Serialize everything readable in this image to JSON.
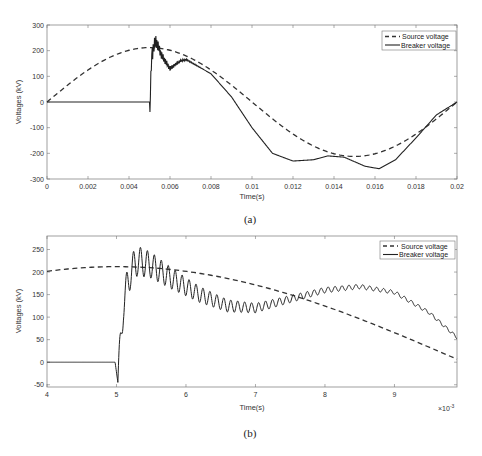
{
  "chart_data": [
    {
      "type": "line",
      "panel": "(a)",
      "caption": "(a)",
      "xlabel": "Time(s)",
      "ylabel": "Voltages (kV)",
      "xlim": [
        0,
        0.02
      ],
      "ylim": [
        -300,
        300
      ],
      "xticks": [
        "0",
        "0.002",
        "0.004",
        "0.006",
        "0.008",
        "0.01",
        "0.012",
        "0.014",
        "0.016",
        "0.018",
        "0.02"
      ],
      "yticks": [
        "300",
        "200",
        "100",
        "0",
        "-100",
        "-200",
        "-300"
      ],
      "legend": {
        "position": "top-right",
        "entries": [
          "Source voltage",
          "Breaker voltage"
        ]
      },
      "grid": false,
      "series": [
        {
          "name": "Source voltage",
          "style": "dashed",
          "x": [
            0,
            0.002,
            0.004,
            0.005,
            0.006,
            0.008,
            0.01,
            0.012,
            0.014,
            0.016,
            0.018,
            0.02
          ],
          "values": [
            0,
            125,
            202,
            212,
            202,
            125,
            0,
            -125,
            -202,
            -212,
            -125,
            0
          ]
        },
        {
          "name": "Breaker voltage",
          "style": "solid",
          "x": [
            0,
            0.005,
            0.00502,
            0.0051,
            0.0053,
            0.0056,
            0.006,
            0.0065,
            0.0068,
            0.008,
            0.009,
            0.01,
            0.011,
            0.012,
            0.013,
            0.0137,
            0.0145,
            0.0155,
            0.0162,
            0.017,
            0.018,
            0.019,
            0.02
          ],
          "values": [
            0,
            0,
            -45,
            180,
            240,
            180,
            130,
            160,
            165,
            110,
            20,
            -100,
            -200,
            -230,
            -225,
            -210,
            -215,
            -250,
            -260,
            -225,
            -140,
            -50,
            0
          ]
        }
      ],
      "annotations": [
        "High-frequency oscillation on breaker voltage after t=0.005 s"
      ]
    },
    {
      "type": "line",
      "panel": "(b)",
      "caption": "(b)",
      "xlabel": "Time(s)",
      "ylabel": "Voltages (kV)",
      "x_multiplier": "×10^-3",
      "xlim": [
        4,
        9.9
      ],
      "ylim": [
        -55,
        280
      ],
      "xticks": [
        "4",
        "5",
        "6",
        "7",
        "8",
        "9"
      ],
      "yticks": [
        "250",
        "200",
        "150",
        "100",
        "50",
        "0",
        "-50"
      ],
      "legend": {
        "position": "top-right",
        "entries": [
          "Source voltage",
          "Breaker voltage"
        ]
      },
      "grid": false,
      "series": [
        {
          "name": "Source voltage",
          "style": "dashed",
          "x": [
            4,
            4.5,
            5,
            5.5,
            6,
            6.5,
            7,
            7.5,
            8,
            8.5,
            9,
            9.5,
            9.9
          ],
          "values": [
            203,
            209,
            212,
            211,
            205,
            195,
            180,
            162,
            140,
            115,
            85,
            50,
            5
          ]
        },
        {
          "name": "Breaker voltage",
          "style": "solid",
          "x": [
            4,
            4.98,
            5.02,
            5.1,
            5.2,
            5.3,
            5.5,
            5.8,
            6.2,
            6.6,
            7,
            7.5,
            8,
            8.5,
            9,
            9.5,
            9.9
          ],
          "values": [
            0,
            0,
            -45,
            130,
            200,
            225,
            215,
            185,
            150,
            125,
            120,
            140,
            160,
            168,
            155,
            110,
            55
          ],
          "oscillation_amplitude_kV": [
            40,
            30,
            20,
            12,
            6,
            3
          ]
        }
      ]
    }
  ],
  "figure": {
    "panel_a": {
      "caption": "(a)",
      "xlabel": "Time(s)",
      "ylabel": "Voltages (kV)",
      "legend_source": "Source voltage",
      "legend_breaker": "Breaker voltage"
    },
    "panel_b": {
      "caption": "(b)",
      "xlabel": "Time(s)",
      "ylabel": "Voltages (kV)",
      "legend_source": "Source voltage",
      "legend_breaker": "Breaker voltage",
      "x_exponent_base": "×10",
      "x_exponent": "-3"
    }
  }
}
